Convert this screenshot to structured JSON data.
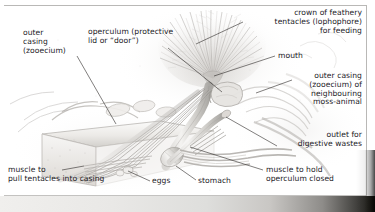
{
  "illustration": {
    "title": "Cutaway illustration of a bryozoan (moss-animal) zooid",
    "subject": "moss-animal (bryozoan) zooid anatomy",
    "style": "greyscale pencil / airbrush scientific diagram",
    "frame_color": "#b9b8b6",
    "text_color": "#23211f",
    "background_color": "#ffffff"
  },
  "labels": [
    {
      "id": "outer-casing-zooecium",
      "text": "outer\ncasing\n(zooecium)",
      "align": "left",
      "x": 23,
      "y": 29,
      "leader": [
        [
          77,
          56
        ],
        [
          116,
          124
        ]
      ]
    },
    {
      "id": "operculum",
      "text": "operculum (protective\nlid or “door”)",
      "align": "left",
      "x": 88,
      "y": 28,
      "leader": [
        [
          168,
          48
        ],
        [
          222,
          92
        ]
      ]
    },
    {
      "id": "crown-of-tentacles",
      "text": "crown of feathery\ntentacles (lophophore)\nfor feeding",
      "align": "right",
      "x": 246,
      "y": 9,
      "right": 13,
      "leader": [
        [
          243,
          22
        ],
        [
          196,
          44
        ]
      ]
    },
    {
      "id": "mouth",
      "text": "mouth",
      "align": "left",
      "x": 278,
      "y": 52,
      "leader": [
        [
          275,
          56
        ],
        [
          214,
          76
        ]
      ]
    },
    {
      "id": "outer-casing-neighbour",
      "text": "outer casing\n(zooecium) of\nneighbouring\nmoss-animal",
      "align": "right",
      "x": 280,
      "y": 72,
      "right": 13,
      "leader": [
        [
          292,
          80
        ],
        [
          256,
          93
        ]
      ]
    },
    {
      "id": "outlet-digestive-wastes",
      "text": "outlet for\ndigestive wastes",
      "align": "right",
      "x": 275,
      "y": 131,
      "right": 13,
      "leader": [
        [
          277,
          146
        ],
        [
          226,
          117
        ]
      ]
    },
    {
      "id": "muscle-hold-operculum",
      "text": "muscle to hold\noperculum closed",
      "align": "left",
      "x": 266,
      "y": 166,
      "leader": [
        [
          263,
          170
        ],
        [
          190,
          147
        ]
      ]
    },
    {
      "id": "muscle-pull-tentacles",
      "text": "muscle to\npull tentacles into casing",
      "align": "left",
      "x": 8,
      "y": 166,
      "leader": [
        [
          62,
          170
        ],
        [
          84,
          166
        ]
      ]
    },
    {
      "id": "eggs",
      "text": "eggs",
      "align": "left",
      "x": 152,
      "y": 177,
      "leader": [
        [
          150,
          181
        ],
        [
          128,
          171
        ]
      ]
    },
    {
      "id": "stomach",
      "text": "stomach",
      "align": "left",
      "x": 198,
      "y": 177,
      "leader": [
        [
          196,
          180
        ],
        [
          176,
          166
        ]
      ]
    }
  ]
}
